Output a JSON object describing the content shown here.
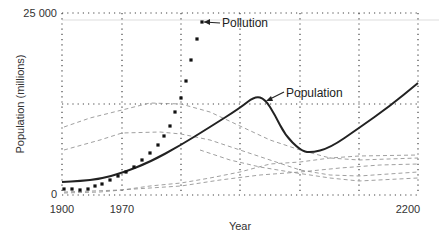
{
  "chart_data": {
    "type": "line",
    "title": "",
    "xlabel": "Year",
    "ylabel": "Population (millions)",
    "x_ticks": [
      {
        "label": "1900",
        "px": 62
      },
      {
        "label": "1970",
        "px": 122
      },
      {
        "label": "2200",
        "px": 408
      }
    ],
    "y_ticks": [
      {
        "label": "25 000",
        "value": 25000
      },
      {
        "label": "0",
        "value": 0
      }
    ],
    "xlim": [
      1900,
      2200
    ],
    "ylim": [
      0,
      25000
    ],
    "grid": true,
    "plot_area": {
      "left": 62,
      "right": 418,
      "top": 13,
      "bottom": 195
    },
    "v_grid_px": [
      62,
      122,
      181,
      240,
      300,
      359,
      418
    ],
    "h_grid_values": [
      12500
    ],
    "series": [
      {
        "name": "Population",
        "style": "solid",
        "points_px": [
          [
            62,
            182
          ],
          [
            80,
            181
          ],
          [
            100,
            179
          ],
          [
            122,
            173
          ],
          [
            150,
            162
          ],
          [
            181,
            145
          ],
          [
            210,
            127
          ],
          [
            240,
            108
          ],
          [
            255,
            96
          ],
          [
            265,
            99
          ],
          [
            275,
            115
          ],
          [
            285,
            135
          ],
          [
            300,
            150
          ],
          [
            310,
            153
          ],
          [
            330,
            148
          ],
          [
            359,
            128
          ],
          [
            390,
            106
          ],
          [
            418,
            83
          ]
        ]
      },
      {
        "name": "Pollution",
        "style": "dots",
        "points_px": [
          [
            64,
            189
          ],
          [
            72,
            189
          ],
          [
            80,
            190
          ],
          [
            88,
            189
          ],
          [
            95,
            186
          ],
          [
            102,
            184
          ],
          [
            110,
            180
          ],
          [
            118,
            176
          ],
          [
            126,
            172
          ],
          [
            134,
            167
          ],
          [
            142,
            160
          ],
          [
            150,
            153
          ],
          [
            158,
            145
          ],
          [
            164,
            136
          ],
          [
            170,
            126
          ],
          [
            175,
            112
          ],
          [
            181,
            98
          ],
          [
            186,
            81
          ],
          [
            191,
            60
          ],
          [
            197,
            39
          ],
          [
            202,
            22
          ]
        ]
      }
    ],
    "annotations": [
      {
        "text": "Pollution",
        "x": 222,
        "y": 27
      },
      {
        "text": "Population",
        "x": 286,
        "y": 97
      }
    ]
  }
}
